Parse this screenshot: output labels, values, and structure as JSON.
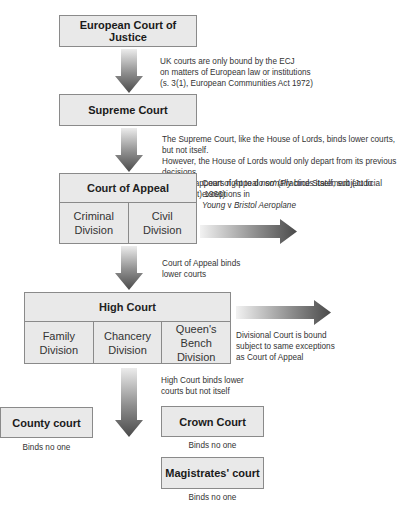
{
  "courts": {
    "ecj": {
      "label": "European Court of Justice"
    },
    "supreme": {
      "label": "Supreme Court"
    },
    "appeal": {
      "label": "Court of Appeal",
      "divisions": [
        {
          "line1": "Criminal",
          "line2": "Division"
        },
        {
          "line1": "Civil",
          "line2": "Division"
        }
      ]
    },
    "high": {
      "label": "High Court",
      "divisions": [
        {
          "line1": "Family",
          "line2": "Division"
        },
        {
          "line1": "Chancery",
          "line2": "Division"
        },
        {
          "line1": "Queen's Bench",
          "line2": "Division"
        }
      ]
    },
    "county": {
      "label": "County court",
      "note": "Binds no one"
    },
    "crown": {
      "label": "Crown Court",
      "note": "Binds no one"
    },
    "magistrates": {
      "label": "Magistrates' court",
      "note": "Binds no one"
    }
  },
  "notes": {
    "ecj": [
      "UK courts are only bound by the ECJ",
      "on matters of European law or institutions",
      "(s. 3(1), European Communities Act 1972)"
    ],
    "supreme": [
      "The Supreme Court, like the House of Lords, binds lower courts, but not itself.",
      "However, the House of Lords would only depart from its previous decisions",
      "‘where it appears right to do so’ (Practice Statement (Judicial Precedent) 1966)"
    ],
    "appeal_self": {
      "pre": "Court of Appeal ",
      "em": "normally",
      "post": " binds itself, subject to exceptions in",
      "line2_a": "Young",
      "line2_b": " v ",
      "line2_c": "Bristol Aeroplane"
    },
    "appeal_lower": [
      "Court of Appeal binds",
      "lower courts"
    ],
    "divisional": [
      "Divisional Court is bound",
      "subject to same exceptions",
      "as Court of Appeal"
    ],
    "high": [
      "High Court binds lower",
      "courts but not itself"
    ]
  },
  "colors": {
    "box_fill": "#e9e9e9",
    "box_border": "#8a8a8a",
    "arrow_dark": "#4a4a4a",
    "arrow_light": "#e6e6e6"
  }
}
